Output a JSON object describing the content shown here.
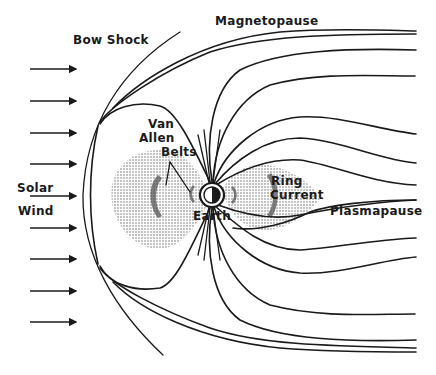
{
  "diagram": {
    "labels": {
      "bow_shock": "Bow Shock",
      "magnetopause": "Magnetopause",
      "van_allen_1": "Van",
      "van_allen_2": "Allen",
      "van_allen_3": "Belts",
      "solar": "Solar",
      "wind": "Wind",
      "ring": "Ring",
      "current": "Current",
      "plasmapause": "Plasmapause",
      "earth": "Earth"
    },
    "solar_wind_arrows": [
      69,
      101,
      133,
      164,
      196,
      228,
      259,
      291,
      322
    ],
    "colors": {
      "ink": "#1a1a1a",
      "background": "#ffffff",
      "stipple": "#9a9a9a"
    }
  }
}
